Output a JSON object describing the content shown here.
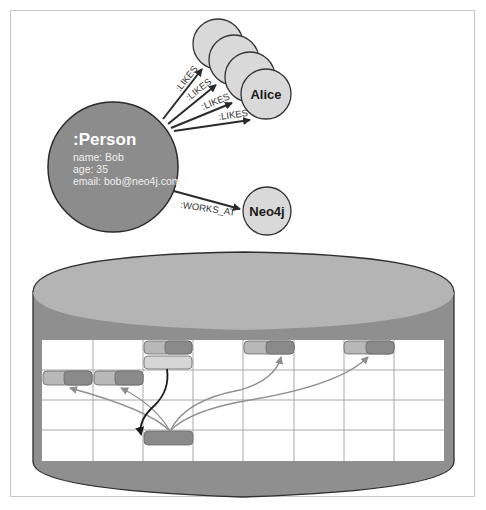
{
  "graph": {
    "person_node": {
      "label": ":Person",
      "properties": [
        "name: Bob",
        "age: 35",
        "email: bob@neo4j.com"
      ]
    },
    "liked_nodes": [
      {
        "label": ""
      },
      {
        "label": ""
      },
      {
        "label": ""
      },
      {
        "label": "Alice"
      }
    ],
    "company_node": {
      "label": "Neo4j"
    },
    "relationships": [
      {
        "type": ":LIKES"
      },
      {
        "type": ":LIKES"
      },
      {
        "type": ":LIKES"
      },
      {
        "type": ":LIKES"
      },
      {
        "type": ":WORKS_AT"
      }
    ]
  },
  "storage": {
    "grid": {
      "columns": 8,
      "rows": 4
    },
    "records": [
      {
        "name": "record-r0-c2-pair",
        "row": 0,
        "col": 2
      },
      {
        "name": "record-r0-c2-single",
        "row": 0,
        "col": 2
      },
      {
        "name": "record-r0-c4-pair",
        "row": 0,
        "col": 4
      },
      {
        "name": "record-r0-c6-pair",
        "row": 0,
        "col": 6
      },
      {
        "name": "record-r1-c0-pair",
        "row": 1,
        "col": 0
      },
      {
        "name": "record-r1-c1-pair",
        "row": 1,
        "col": 1
      },
      {
        "name": "record-r3-c2-node",
        "row": 3,
        "col": 2
      }
    ]
  },
  "colors": {
    "person_fill": "#8c8c8c",
    "liked_fill": "#d9d9d9",
    "cylinder_top": "#b4b4b4",
    "cylinder_body": "#8f8f8f",
    "record_light": "#b8b8b8",
    "record_dark": "#8a8a8a",
    "record_pale": "#d6d6d6",
    "pointer_gray": "#909090",
    "pointer_dark": "#222222"
  }
}
